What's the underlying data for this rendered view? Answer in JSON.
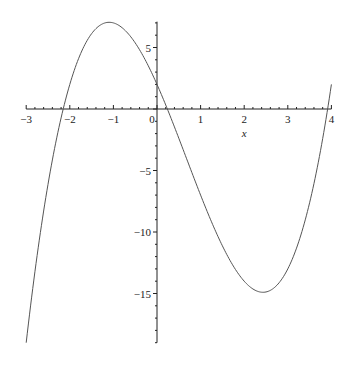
{
  "chart_data": {
    "type": "line",
    "title": "",
    "xlabel": "x",
    "ylabel": "",
    "expression": "x^3 - 2x^2 - 8x + 2",
    "xlim": [
      -3,
      4
    ],
    "ylim": [
      -19,
      7.1
    ],
    "x_ticks": [
      "-3",
      "-2",
      "-1",
      "0",
      "1",
      "2",
      "3",
      "4"
    ],
    "y_ticks": [
      "5",
      "-5",
      "-10",
      "-15"
    ],
    "grid": false,
    "legend": null,
    "series": [
      {
        "name": "f(x)",
        "color": "#555555",
        "x": [
          -3,
          -2.5,
          -2,
          -1.5,
          -1,
          -0.5,
          0,
          0.5,
          1,
          1.5,
          2,
          2.5,
          3,
          3.5,
          4
        ],
        "y": [
          -19,
          -6.125,
          2,
          5.125,
          7,
          5.375,
          2,
          -2.375,
          -7,
          -11.125,
          -14,
          -14.875,
          -13,
          -7.625,
          2
        ]
      }
    ],
    "annotations": []
  }
}
